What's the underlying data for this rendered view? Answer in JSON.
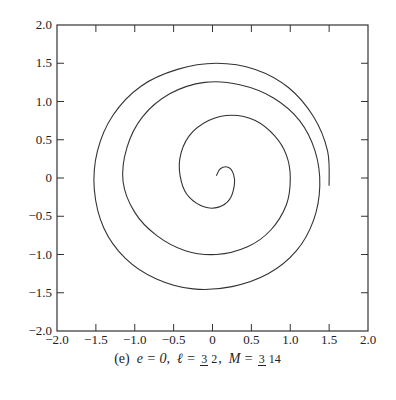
{
  "chart_data": {
    "type": "line",
    "title": "",
    "caption": {
      "label": "(e)",
      "e": "e = 0,",
      "l_symbol": "ℓ =",
      "l_num": "3",
      "l_den": "2",
      "sep": ",",
      "M_symbol": "M =",
      "M_num": "3",
      "M_den": "14"
    },
    "xlabel": "",
    "ylabel": "",
    "xlim": [
      -2.0,
      2.0
    ],
    "ylim": [
      -2.0,
      2.0
    ],
    "grid": false,
    "legend": null,
    "xticks": [
      "−2.0",
      "−1.5",
      "−1.0",
      "−0.5",
      "0",
      "0.5",
      "1.0",
      "1.5",
      "2.0"
    ],
    "yticks": [
      "2.0",
      "1.5",
      "1.0",
      "0.5",
      "0",
      "−0.5",
      "−1.0",
      "−1.5",
      "−2.0"
    ],
    "xtick_values": [
      -2.0,
      -1.5,
      -1.0,
      -0.5,
      0,
      0.5,
      1.0,
      1.5,
      2.0
    ],
    "ytick_values": [
      2.0,
      1.5,
      1.0,
      0.5,
      0,
      -0.5,
      -1.0,
      -1.5,
      -2.0
    ],
    "series": [
      {
        "name": "orbit",
        "description": "Spiral orbit starting near origin (~0.05, 0.03), winding outward counterclockwise in ~2.5 turns, ending at (1.0, 0.0)",
        "points": [
          [
            0.05,
            0.03
          ],
          [
            0.1,
            0.12
          ],
          [
            0.2,
            0.14
          ],
          [
            0.27,
            0.05
          ],
          [
            0.28,
            -0.1
          ],
          [
            0.22,
            -0.28
          ],
          [
            0.08,
            -0.38
          ],
          [
            -0.1,
            -0.38
          ],
          [
            -0.3,
            -0.25
          ],
          [
            -0.4,
            -0.05
          ],
          [
            -0.42,
            0.25
          ],
          [
            -0.3,
            0.55
          ],
          [
            -0.05,
            0.75
          ],
          [
            0.25,
            0.82
          ],
          [
            0.55,
            0.75
          ],
          [
            0.8,
            0.55
          ],
          [
            0.95,
            0.3
          ],
          [
            1.0,
            0.0
          ],
          [
            0.95,
            -0.35
          ],
          [
            0.75,
            -0.68
          ],
          [
            0.45,
            -0.9
          ],
          [
            0.05,
            -1.0
          ],
          [
            -0.35,
            -0.95
          ],
          [
            -0.72,
            -0.75
          ],
          [
            -1.0,
            -0.45
          ],
          [
            -1.15,
            -0.05
          ],
          [
            -1.1,
            0.4
          ],
          [
            -0.9,
            0.8
          ],
          [
            -0.55,
            1.1
          ],
          [
            -0.1,
            1.25
          ],
          [
            0.35,
            1.22
          ],
          [
            0.78,
            1.05
          ],
          [
            1.12,
            0.75
          ],
          [
            1.32,
            0.35
          ],
          [
            1.38,
            -0.1
          ],
          [
            1.3,
            -0.55
          ],
          [
            1.08,
            -0.95
          ],
          [
            0.72,
            -1.25
          ],
          [
            0.25,
            -1.42
          ],
          [
            -0.25,
            -1.45
          ],
          [
            -0.72,
            -1.32
          ],
          [
            -1.12,
            -1.05
          ],
          [
            -1.4,
            -0.65
          ],
          [
            -1.52,
            -0.15
          ],
          [
            -1.48,
            0.35
          ],
          [
            -1.28,
            0.82
          ],
          [
            -0.92,
            1.2
          ],
          [
            -0.45,
            1.42
          ],
          [
            0.05,
            1.5
          ],
          [
            0.55,
            1.42
          ],
          [
            0.98,
            1.18
          ],
          [
            1.3,
            0.8
          ],
          [
            1.48,
            0.35
          ],
          [
            1.5,
            -0.1
          ]
        ]
      }
    ]
  }
}
